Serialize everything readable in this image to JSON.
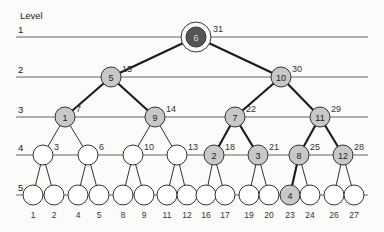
{
  "diagram": {
    "level_heading": "Level",
    "levels": [
      {
        "label": "1",
        "y": 37
      },
      {
        "label": "2",
        "y": 77
      },
      {
        "label": "3",
        "y": 117
      },
      {
        "label": "4",
        "y": 155
      },
      {
        "label": "5",
        "y": 195
      }
    ],
    "nodes": [
      {
        "id": "n31",
        "x": 196,
        "y": 37,
        "label": "6",
        "side": "31",
        "fill": "#555555",
        "ring": true
      },
      {
        "id": "n15",
        "x": 111,
        "y": 77,
        "label": "5",
        "side": "15",
        "fill": "#c8c8c8"
      },
      {
        "id": "n30",
        "x": 281,
        "y": 77,
        "label": "10",
        "side": "30",
        "fill": "#c8c8c8"
      },
      {
        "id": "n7",
        "x": 65,
        "y": 117,
        "label": "1",
        "side": "7",
        "fill": "#c8c8c8"
      },
      {
        "id": "n14",
        "x": 155,
        "y": 117,
        "label": "9",
        "side": "14",
        "fill": "#c8c8c8"
      },
      {
        "id": "n22",
        "x": 235,
        "y": 117,
        "label": "7",
        "side": "22",
        "fill": "#c8c8c8"
      },
      {
        "id": "n29",
        "x": 320,
        "y": 117,
        "label": "11",
        "side": "29",
        "fill": "#c8c8c8"
      },
      {
        "id": "n3",
        "x": 43,
        "y": 155,
        "label": "",
        "side": "3",
        "fill": "#ffffff"
      },
      {
        "id": "n6",
        "x": 88,
        "y": 155,
        "label": "",
        "side": "6",
        "fill": "#ffffff"
      },
      {
        "id": "n10",
        "x": 133,
        "y": 155,
        "label": "",
        "side": "10",
        "fill": "#ffffff"
      },
      {
        "id": "n13",
        "x": 177,
        "y": 155,
        "label": "",
        "side": "13",
        "fill": "#ffffff"
      },
      {
        "id": "n18",
        "x": 214,
        "y": 155,
        "label": "2",
        "side": "18",
        "fill": "#c8c8c8"
      },
      {
        "id": "n21",
        "x": 258,
        "y": 155,
        "label": "3",
        "side": "21",
        "fill": "#c8c8c8"
      },
      {
        "id": "n25",
        "x": 299,
        "y": 155,
        "label": "8",
        "side": "25",
        "fill": "#c8c8c8"
      },
      {
        "id": "n28",
        "x": 343,
        "y": 155,
        "label": "12",
        "side": "28",
        "fill": "#c8c8c8"
      },
      {
        "id": "n1",
        "x": 33,
        "y": 195,
        "label": "",
        "bottom": "1",
        "fill": "#ffffff"
      },
      {
        "id": "n2",
        "x": 54,
        "y": 195,
        "label": "",
        "bottom": "2",
        "fill": "#ffffff"
      },
      {
        "id": "n4",
        "x": 78,
        "y": 195,
        "label": "",
        "bottom": "4",
        "fill": "#ffffff"
      },
      {
        "id": "n5",
        "x": 99,
        "y": 195,
        "label": "",
        "bottom": "5",
        "fill": "#ffffff"
      },
      {
        "id": "n8",
        "x": 123,
        "y": 195,
        "label": "",
        "bottom": "8",
        "fill": "#ffffff"
      },
      {
        "id": "n9",
        "x": 144,
        "y": 195,
        "label": "",
        "bottom": "9",
        "fill": "#ffffff"
      },
      {
        "id": "n11",
        "x": 167,
        "y": 195,
        "label": "",
        "bottom": "11",
        "fill": "#ffffff"
      },
      {
        "id": "n12",
        "x": 187,
        "y": 195,
        "label": "",
        "bottom": "12",
        "fill": "#ffffff"
      },
      {
        "id": "n16",
        "x": 206,
        "y": 195,
        "label": "",
        "bottom": "16",
        "fill": "#ffffff"
      },
      {
        "id": "n17",
        "x": 225,
        "y": 195,
        "label": "",
        "bottom": "17",
        "fill": "#ffffff"
      },
      {
        "id": "n19",
        "x": 249,
        "y": 195,
        "label": "",
        "bottom": "19",
        "fill": "#ffffff"
      },
      {
        "id": "n20",
        "x": 269,
        "y": 195,
        "label": "",
        "bottom": "20",
        "fill": "#ffffff"
      },
      {
        "id": "n23",
        "x": 290,
        "y": 195,
        "label": "4",
        "bottom": "23",
        "fill": "#c8c8c8"
      },
      {
        "id": "n24",
        "x": 310,
        "y": 195,
        "label": "",
        "bottom": "24",
        "fill": "#ffffff"
      },
      {
        "id": "n26",
        "x": 334,
        "y": 195,
        "label": "",
        "bottom": "26",
        "fill": "#ffffff"
      },
      {
        "id": "n27",
        "x": 354,
        "y": 195,
        "label": "",
        "bottom": "27",
        "fill": "#ffffff"
      }
    ],
    "edges": [
      [
        "n31",
        "n15",
        1
      ],
      [
        "n31",
        "n30",
        1
      ],
      [
        "n15",
        "n7",
        1
      ],
      [
        "n15",
        "n14",
        1
      ],
      [
        "n30",
        "n22",
        1
      ],
      [
        "n30",
        "n29",
        1
      ],
      [
        "n7",
        "n3",
        0
      ],
      [
        "n7",
        "n6",
        0
      ],
      [
        "n14",
        "n10",
        0
      ],
      [
        "n14",
        "n13",
        0
      ],
      [
        "n22",
        "n18",
        1
      ],
      [
        "n22",
        "n21",
        1
      ],
      [
        "n29",
        "n25",
        1
      ],
      [
        "n29",
        "n28",
        1
      ],
      [
        "n3",
        "n1",
        0
      ],
      [
        "n3",
        "n2",
        0
      ],
      [
        "n6",
        "n4",
        0
      ],
      [
        "n6",
        "n5",
        0
      ],
      [
        "n10",
        "n8",
        0
      ],
      [
        "n10",
        "n9",
        0
      ],
      [
        "n13",
        "n11",
        0
      ],
      [
        "n13",
        "n12",
        0
      ],
      [
        "n18",
        "n16",
        0
      ],
      [
        "n18",
        "n17",
        0
      ],
      [
        "n21",
        "n19",
        0
      ],
      [
        "n21",
        "n20",
        0
      ],
      [
        "n25",
        "n23",
        1
      ],
      [
        "n25",
        "n24",
        0
      ],
      [
        "n28",
        "n26",
        0
      ],
      [
        "n28",
        "n27",
        0
      ]
    ]
  }
}
